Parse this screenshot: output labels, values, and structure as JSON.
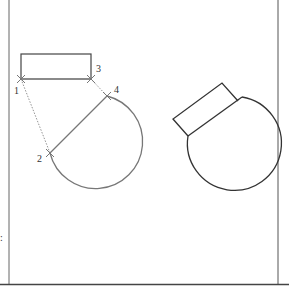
{
  "figure": {
    "left_panel": {
      "description": "Construction of a rectangle attached to a circular arc",
      "points": [
        {
          "id": "1",
          "label": "1"
        },
        {
          "id": "2",
          "label": "2"
        },
        {
          "id": "3",
          "label": "3"
        },
        {
          "id": "4",
          "label": "4"
        }
      ]
    },
    "right_panel": {
      "description": "Result: rotated rectangle attached to circle"
    },
    "margin_mark": ":"
  },
  "colors": {
    "stroke_dark": "#333333",
    "stroke_gray": "#777777",
    "border": "#555555"
  }
}
